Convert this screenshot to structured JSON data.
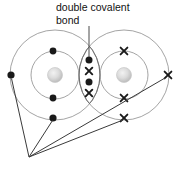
{
  "diagram": {
    "type": "dot-and-cross-diagram",
    "title": "double covalent bond",
    "annotation": {
      "line1": "double covalent",
      "line2": "bond",
      "pointer_from": [
        89,
        26
      ],
      "pointer_to": [
        89,
        57
      ]
    },
    "colors": {
      "shell_stroke": "#9a9a9a",
      "nucleus_outer": "#bfbfbf",
      "nucleus_inner": "#e8e8e8",
      "electron_dot": "#1a1a1a",
      "electron_cross": "#1a1a1a",
      "leader_line": "#3a3a3a",
      "text": "#111111",
      "background": "#ffffff"
    },
    "atoms": [
      {
        "name": "left-atom",
        "electron_symbol": "dot",
        "nucleus": {
          "cx": 55,
          "cy": 75,
          "r": 7.5
        },
        "inner_shell": {
          "cx": 55,
          "cy": 75,
          "r": 24
        },
        "outer_shell": {
          "cx": 55,
          "cy": 75,
          "r": 45
        },
        "inner_electrons": [
          {
            "x": 53,
            "y": 51
          },
          {
            "x": 53,
            "y": 98
          }
        ],
        "outer_electrons": [
          {
            "x": 11,
            "y": 75
          },
          {
            "x": 53,
            "y": 118
          }
        ]
      },
      {
        "name": "right-atom",
        "electron_symbol": "cross",
        "nucleus": {
          "cx": 124,
          "cy": 75,
          "r": 7.5
        },
        "inner_shell": {
          "cx": 124,
          "cy": 75,
          "r": 24
        },
        "outer_shell": {
          "cx": 124,
          "cy": 75,
          "r": 45
        },
        "inner_electrons": [
          {
            "x": 124,
            "y": 51
          },
          {
            "x": 124,
            "y": 98
          }
        ],
        "outer_electrons": [
          {
            "x": 168,
            "y": 75
          },
          {
            "x": 124,
            "y": 118
          }
        ]
      }
    ],
    "shared_electrons": {
      "name": "bonding-pair-region",
      "count": 4,
      "pairs": 2,
      "items": [
        {
          "x": 89,
          "y": 60,
          "symbol": "dot"
        },
        {
          "x": 89,
          "y": 71,
          "symbol": "cross"
        },
        {
          "x": 89,
          "y": 82,
          "symbol": "dot"
        },
        {
          "x": 89,
          "y": 93,
          "symbol": "cross"
        }
      ]
    },
    "leader_lines": {
      "converge_at": [
        29,
        157
      ],
      "targets": [
        {
          "name": "leader-to-left-outer-electron",
          "x": 11,
          "y": 78
        },
        {
          "name": "leader-to-left-bottom-electron",
          "x": 53,
          "y": 120
        },
        {
          "name": "leader-to-right-bottom-cross",
          "x": 124,
          "y": 120
        },
        {
          "name": "leader-to-right-outer-cross",
          "x": 166,
          "y": 78
        }
      ]
    }
  }
}
